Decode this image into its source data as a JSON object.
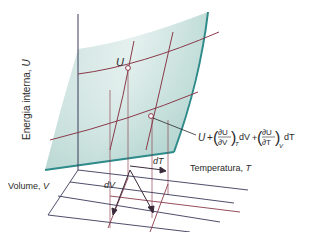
{
  "diagram": {
    "type": "3d-surface-thermodynamics",
    "axes": {
      "vertical": {
        "label": "Energia interna, ",
        "symbol": "U"
      },
      "temperature": {
        "label": "Temperatura, ",
        "symbol": "T"
      },
      "volume": {
        "label": "Volume, ",
        "symbol": "V"
      }
    },
    "points": {
      "start": {
        "symbol": "U"
      },
      "end": {
        "expression": {
          "base": "U",
          "plus1": "+",
          "term1_num": "∂U",
          "term1_den": "∂V",
          "term1_sub": "T",
          "term1_diff": "dV",
          "plus2": "+",
          "term2_num": "∂U",
          "term2_den": "∂T",
          "term2_sub": "V",
          "term2_diff": "dT"
        }
      }
    },
    "increments": {
      "dV": "dV",
      "dT": "dT"
    },
    "colors": {
      "surface_fill": "#cfe6e2",
      "surface_edge": "#2f8a8a",
      "grid_lines": "#8a3a4a",
      "axis_lines": "#3a3a5a",
      "text": "#2a2a2a"
    }
  }
}
